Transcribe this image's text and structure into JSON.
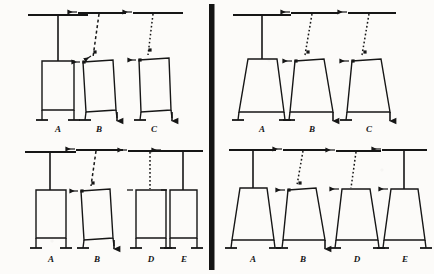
{
  "figure": {
    "panel_divider": "vertical-bar",
    "stroke_color": "#161616",
    "background_color": "#fcfbf9",
    "label_color": "#151515"
  },
  "panels": [
    {
      "id": "top-left",
      "leg_type": "parallel",
      "figures": [
        {
          "label": "A",
          "plumb_line": "solid",
          "arrows": [],
          "foot_arrow": "none"
        },
        {
          "label": "B",
          "plumb_line": "dashed",
          "arrows": [
            "top-left",
            "mid-right",
            "body-left"
          ],
          "foot_arrow": "right"
        },
        {
          "label": "C",
          "plumb_line": "dotted",
          "arrows": [
            "top-left",
            "mid-right",
            "body-left"
          ],
          "foot_arrow": "right"
        }
      ]
    },
    {
      "id": "top-right",
      "leg_type": "splayed",
      "figures": [
        {
          "label": "A",
          "plumb_line": "solid",
          "arrows": [],
          "foot_arrow": "none"
        },
        {
          "label": "B",
          "plumb_line": "dotted",
          "arrows": [
            "top-left",
            "mid-right",
            "body-left"
          ],
          "foot_arrow": "right"
        },
        {
          "label": "C",
          "plumb_line": "dotted",
          "arrows": [
            "top-left",
            "mid-right",
            "body-left"
          ],
          "foot_arrow": "right"
        }
      ]
    },
    {
      "id": "bottom-left",
      "leg_type": "parallel",
      "figures": [
        {
          "label": "A",
          "plumb_line": "solid",
          "arrows": [],
          "foot_arrow": "none"
        },
        {
          "label": "B",
          "plumb_line": "dashed",
          "arrows": [
            "top-left",
            "mid-right",
            "body-left"
          ],
          "foot_arrow": "right"
        },
        {
          "label": "D",
          "plumb_line": "dotted",
          "arrows": [
            "top-left",
            "body-left-tick"
          ],
          "foot_arrow": "none"
        },
        {
          "label": "E",
          "plumb_line": "solid",
          "arrows": [
            "top-left",
            "body-left-tick"
          ],
          "foot_arrow": "none"
        }
      ]
    },
    {
      "id": "bottom-right",
      "leg_type": "splayed",
      "figures": [
        {
          "label": "A",
          "plumb_line": "solid",
          "arrows": [],
          "foot_arrow": "none"
        },
        {
          "label": "B",
          "plumb_line": "dotted",
          "arrows": [
            "top-left",
            "mid-right",
            "body-left"
          ],
          "foot_arrow": "right"
        },
        {
          "label": "D",
          "plumb_line": "dotted",
          "arrows": [
            "top-left",
            "body-left"
          ],
          "foot_arrow": "none"
        },
        {
          "label": "E",
          "plumb_line": "solid",
          "arrows": [
            "top-left",
            "body-left"
          ],
          "foot_arrow": "none"
        }
      ]
    }
  ],
  "labels": {
    "tl": [
      "A",
      "B",
      "C"
    ],
    "tr": [
      "A",
      "B",
      "C"
    ],
    "bl": [
      "A",
      "B",
      "D",
      "E"
    ],
    "br": [
      "A",
      "B",
      "D",
      "E"
    ]
  }
}
